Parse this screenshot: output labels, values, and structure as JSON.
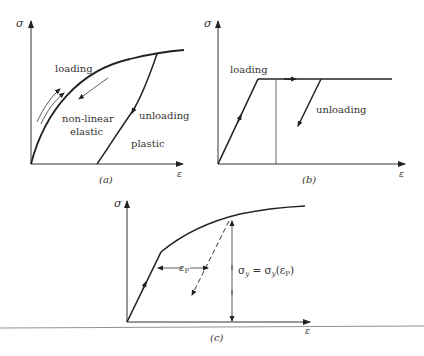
{
  "figure": {
    "panels": [
      {
        "id": "a",
        "caption": "(a)",
        "y_axis_label": "σ",
        "x_axis_label": "ε",
        "labels": {
          "loading": "loading",
          "nonlinear_line1": "non-linear",
          "nonlinear_line2": "elastic",
          "unloading": "unloading",
          "plastic": "plastic"
        }
      },
      {
        "id": "b",
        "caption": "(b)",
        "y_axis_label": "σ",
        "x_axis_label": "ε",
        "labels": {
          "loading": "loading",
          "unloading": "unloading"
        }
      },
      {
        "id": "c",
        "caption": "(c)",
        "y_axis_label": "σ",
        "x_axis_label": "ε",
        "labels": {
          "plastic_strain": "ε",
          "plastic_strain_sub": "P",
          "yield_eq_lhs": "σ",
          "yield_eq_lhs_sub": "y",
          "yield_eq_mid": " = σ",
          "yield_eq_mid_sub": "y",
          "yield_eq_rhs": "(ε",
          "yield_eq_rhs_sub": "P",
          "yield_eq_close": ")"
        }
      }
    ],
    "colors": {
      "ink": "#222222",
      "thin": "#555555"
    }
  }
}
